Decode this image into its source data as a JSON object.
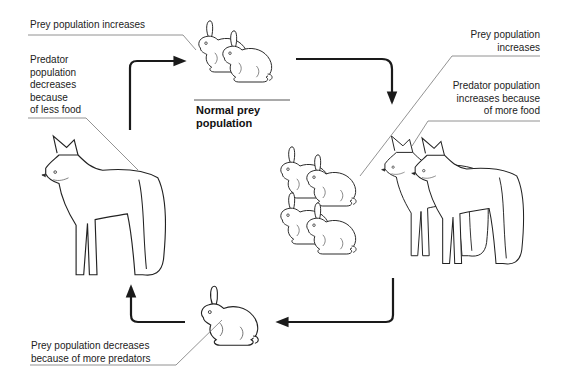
{
  "diagram": {
    "center_label": {
      "lines": [
        "Normal prey",
        "population"
      ]
    },
    "labels": {
      "top_left": {
        "lines": [
          "Prey population increases"
        ]
      },
      "left": {
        "lines": [
          "Predator",
          "population",
          "decreases",
          "because",
          "of less food"
        ]
      },
      "right_top": {
        "lines": [
          "Prey population",
          "increases"
        ]
      },
      "right_mid": {
        "lines": [
          "Predator population",
          "increases because",
          "of more food"
        ]
      },
      "bottom_left": {
        "lines": [
          "Prey population decreases",
          "because of more predators"
        ]
      }
    },
    "nodes": [
      {
        "id": "normal-prey",
        "figure": "two-rabbits",
        "position": "top-center"
      },
      {
        "id": "many-prey-and-predators",
        "figure": "four-rabbits-two-foxes",
        "position": "right"
      },
      {
        "id": "few-prey",
        "figure": "one-rabbit",
        "position": "bottom-center"
      },
      {
        "id": "few-predators",
        "figure": "one-fox",
        "position": "left"
      }
    ],
    "arrows": [
      {
        "from": "few-predators",
        "to": "normal-prey",
        "direction": "up-then-right"
      },
      {
        "from": "normal-prey",
        "to": "many-prey-and-predators",
        "direction": "right-then-down"
      },
      {
        "from": "many-prey-and-predators",
        "to": "few-prey",
        "direction": "down-then-left"
      },
      {
        "from": "few-prey",
        "to": "few-predators",
        "direction": "left-then-up"
      }
    ],
    "colors": {
      "ink": "#1a1a1a",
      "leader_line": "#777777",
      "background": "#ffffff"
    }
  }
}
